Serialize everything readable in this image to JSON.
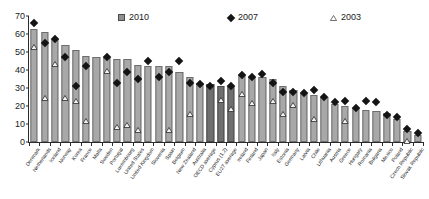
{
  "chart_data": {
    "type": "bar",
    "title": "",
    "subtitle": "",
    "xlabel": "",
    "ylabel": "",
    "ylim": [
      0,
      70
    ],
    "ytick_step": 10,
    "yticks": [
      0,
      10,
      20,
      30,
      40,
      50,
      60,
      70
    ],
    "grid": false,
    "legend_position": "top-center",
    "categories": [
      "Denmark",
      "Netherlands",
      "Iceland",
      "Norway",
      "Korea",
      "France",
      "Malta",
      "Sweden",
      "Portugal",
      "Luxembourg",
      "United States",
      "United Kingdom",
      "Slovenia",
      "Spain",
      "Belgium",
      "New Zealand",
      "Australia",
      "OECD average",
      "Cyprus (1,2)",
      "EU27 average",
      "Ireland",
      "Finland",
      "Japan",
      "Italy",
      "Estonia",
      "Germany",
      "Latvia",
      "Chile",
      "Lithuania",
      "Austria",
      "Greece",
      "Hungary",
      "Romania",
      "Bulgaria",
      "Mexico",
      "Poland",
      "Czech Republic",
      "Slovak Republic"
    ],
    "series": [
      {
        "name": "2010",
        "symbol": "bar",
        "color": "#a8a8a8",
        "values": [
          63,
          61,
          57,
          54,
          51,
          48,
          47,
          47,
          46,
          46,
          43,
          42,
          42,
          42,
          39,
          36,
          33,
          32,
          31,
          31,
          37,
          36,
          36,
          35,
          31,
          29,
          27,
          26,
          25,
          21,
          20,
          19,
          18,
          17,
          16,
          13,
          6,
          4
        ]
      },
      {
        "name": "2007",
        "symbol": "diamond",
        "color": "#141414",
        "values": [
          66,
          55,
          57,
          47,
          31,
          42,
          null,
          47,
          33,
          39,
          35,
          45,
          36,
          39,
          45,
          33,
          32,
          31,
          34,
          31,
          37,
          36,
          38,
          33,
          28,
          28,
          27,
          29,
          25,
          22,
          23,
          19,
          23,
          22,
          15,
          14,
          7,
          5
        ]
      },
      {
        "name": "2003",
        "symbol": "triangle",
        "color": "#ffffff",
        "values": [
          57,
          29,
          48,
          29,
          27,
          16,
          null,
          44,
          13,
          14,
          11,
          null,
          null,
          11,
          null,
          20,
          null,
          null,
          28,
          23,
          31,
          26,
          null,
          27,
          20,
          25,
          null,
          17,
          null,
          null,
          16,
          null,
          null,
          null,
          null,
          null,
          5,
          null
        ]
      }
    ]
  },
  "legend": {
    "items": [
      {
        "label": "2010",
        "icon": "square-marker"
      },
      {
        "label": "2007",
        "icon": "diamond-marker"
      },
      {
        "label": "2003",
        "icon": "triangle-marker"
      }
    ]
  }
}
